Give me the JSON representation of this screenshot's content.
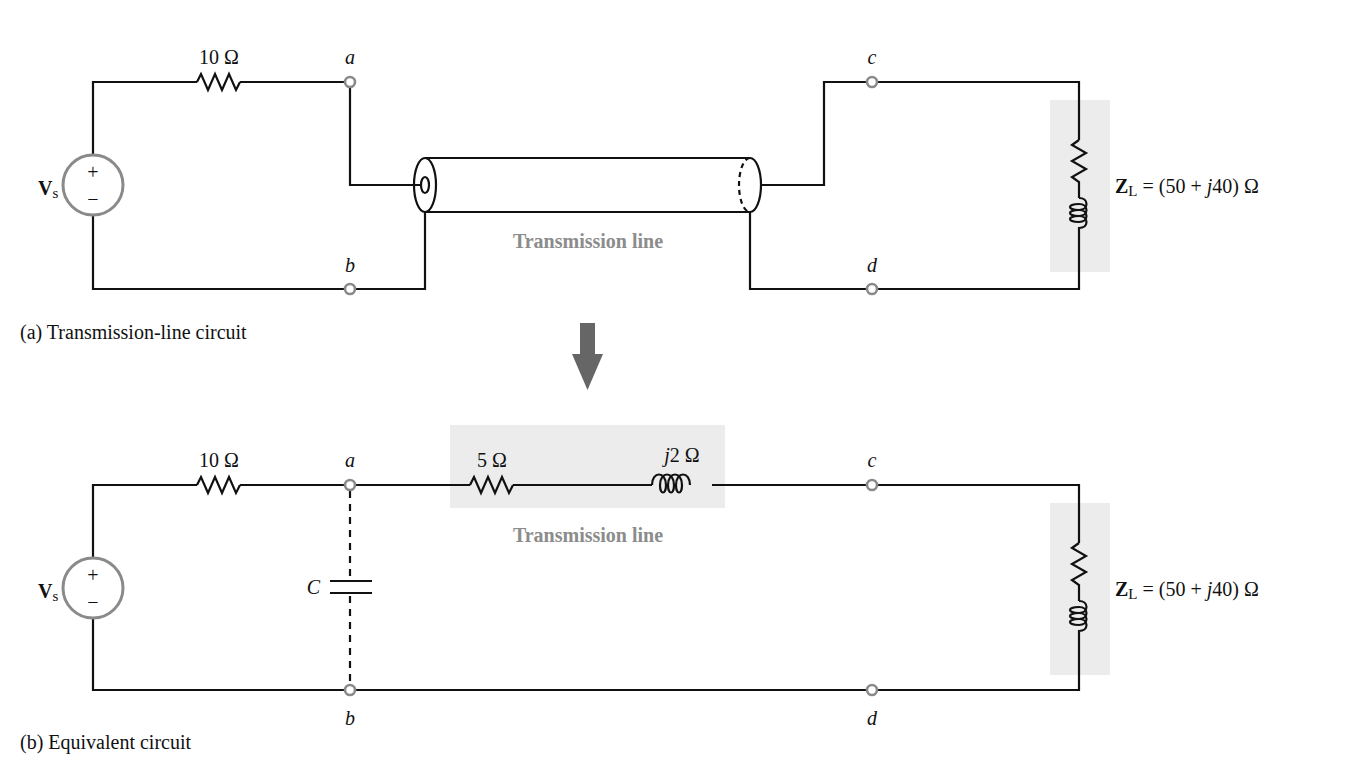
{
  "figure_a": {
    "caption": "(a) Transmission-line circuit",
    "source_label": "V",
    "source_sub": "s",
    "source_plus": "+",
    "source_minus": "−",
    "series_resistor": "10 Ω",
    "nodes": {
      "a": "a",
      "b": "b",
      "c": "c",
      "d": "d"
    },
    "line_label": "Transmission line",
    "load_label_main": "Z",
    "load_label_sub": "L",
    "load_label_pre": " = (50 + ",
    "load_label_j": "j",
    "load_label_post": "40) Ω"
  },
  "arrow": {
    "direction": "down",
    "color": "#666666"
  },
  "figure_b": {
    "caption": "(b) Equivalent circuit",
    "source_label": "V",
    "source_sub": "s",
    "source_plus": "+",
    "source_minus": "−",
    "series_resistor": "10 Ω",
    "capacitor_label": "C",
    "line_resistor": "5 Ω",
    "line_inductor_j": "j",
    "line_inductor": "2 Ω",
    "nodes": {
      "a": "a",
      "b": "b",
      "c": "c",
      "d": "d"
    },
    "line_label": "Transmission line",
    "load_label_main": "Z",
    "load_label_sub": "L",
    "load_label_pre": " = (50 + ",
    "load_label_j": "j",
    "load_label_post": "40) Ω"
  },
  "colors": {
    "wire": "#111111",
    "terminal": "#8a8a8a",
    "shade": "#ececec",
    "line_text": "#8c8c8c"
  }
}
